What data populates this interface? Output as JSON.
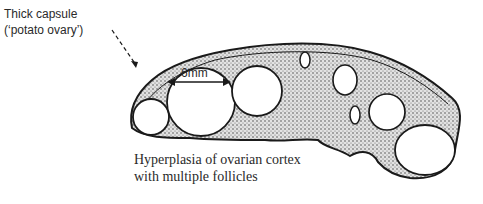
{
  "diagram": {
    "annotations": {
      "capsule_line1": "Thick capsule",
      "capsule_line2": "(‘potato ovary’)",
      "measurement": "6mm",
      "caption_line1": "Hyperplasia of ovarian cortex",
      "caption_line2": "with multiple follicles"
    },
    "colors": {
      "ink": "#1a1a1a",
      "background": "#ffffff",
      "stroma_fill": "#bdbdbd"
    }
  }
}
